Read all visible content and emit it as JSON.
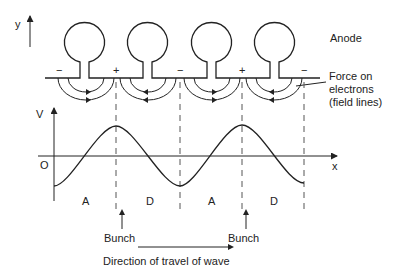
{
  "diagram": {
    "axes": {
      "y_label": "y",
      "v_label": "V",
      "x_label": "x",
      "origin_label": "O"
    },
    "anode_label": "Anode",
    "force_label": {
      "line1": "Force on",
      "line2": "electrons",
      "line3": "(field lines)"
    },
    "pole_signs": [
      "−",
      "+",
      "−",
      "+",
      "−"
    ],
    "region_labels": [
      "A",
      "D",
      "A",
      "D"
    ],
    "bunch_labels": [
      "Bunch",
      "Bunch"
    ],
    "direction_label": "Direction of travel of wave",
    "colors": {
      "line": "#222222",
      "dash": "#555555",
      "background": "#ffffff"
    }
  }
}
